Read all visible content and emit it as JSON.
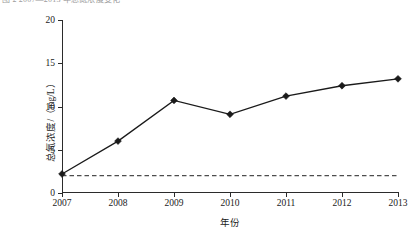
{
  "figure": {
    "top_caption_fragment": "图 2  2007—2013 年总氮浓度变化"
  },
  "chart_data": {
    "type": "line",
    "title": "",
    "subtitle": "",
    "xlabel": "年份",
    "ylabel": "总氮浓度/（mg/L）",
    "categories": [
      "2007",
      "2008",
      "2009",
      "2010",
      "2011",
      "2012",
      "2013"
    ],
    "x": [
      2007,
      2008,
      2009,
      2010,
      2011,
      2012,
      2013
    ],
    "series": [
      {
        "name": "总氮浓度",
        "values": [
          2.2,
          6.0,
          10.7,
          9.1,
          11.2,
          12.4,
          13.2
        ],
        "color": "#1a1a1a",
        "marker": "diamond",
        "linestyle": "solid"
      }
    ],
    "reference_line": {
      "name": "标准限值",
      "value": 2.0,
      "orientation": "horizontal",
      "linestyle": "dashed",
      "color": "#4d4d4d"
    },
    "ylim": [
      0,
      20
    ],
    "yticks": [
      0,
      5,
      10,
      15,
      20
    ],
    "ytick_labels": [
      "0",
      "5",
      "10",
      "15",
      "20"
    ],
    "xlim": [
      2007,
      2013
    ],
    "xticks": [
      2007,
      2008,
      2009,
      2010,
      2011,
      2012,
      2013
    ],
    "grid": false,
    "legend": false,
    "legend_position": "none",
    "spines": [
      "left",
      "bottom"
    ],
    "tick_direction": "out",
    "annotations": []
  }
}
